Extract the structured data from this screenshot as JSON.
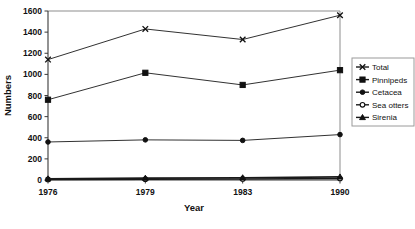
{
  "chart_data": {
    "type": "line",
    "title": "",
    "xlabel": "Year",
    "ylabel": "Numbers",
    "categories": [
      "1976",
      "1979",
      "1983",
      "1990"
    ],
    "ylim": [
      0,
      1600
    ],
    "ytick_step": 200,
    "yticks": [
      "0",
      "200",
      "400",
      "600",
      "800",
      "1000",
      "1200",
      "1400",
      "1600"
    ],
    "grid": false,
    "legend_position": "right",
    "series": [
      {
        "name": "Total",
        "marker": "cross-x",
        "values": [
          1140,
          1430,
          1330,
          1560
        ]
      },
      {
        "name": "Pinnipeds",
        "marker": "filled-square",
        "values": [
          760,
          1015,
          900,
          1040
        ]
      },
      {
        "name": "Cetacea",
        "marker": "filled-circle",
        "values": [
          360,
          380,
          375,
          430
        ]
      },
      {
        "name": "Sea otters",
        "marker": "open-circle",
        "values": [
          5,
          8,
          10,
          14
        ]
      },
      {
        "name": "Sirenia",
        "marker": "filled-triangle",
        "values": [
          12,
          18,
          22,
          30
        ]
      }
    ]
  },
  "colors": {
    "series_stroke": "#1a1a1a",
    "axis": "#3a3a3a",
    "frame": "#8d8d8d",
    "text": "#111111",
    "background": "#ffffff"
  }
}
